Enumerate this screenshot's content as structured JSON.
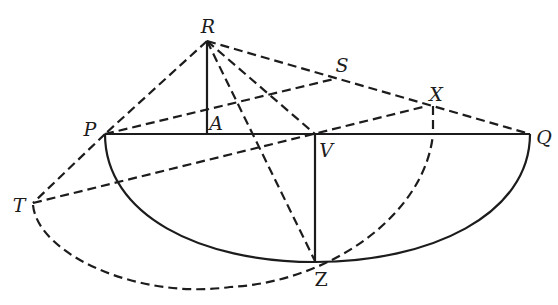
{
  "diagram": {
    "type": "geometry-construction",
    "stroke_color": "#1c1c1c",
    "background": "#ffffff",
    "points": [
      {
        "id": "R",
        "label": "R",
        "x": 207,
        "y": 41,
        "label_x": 208,
        "label_y": 26,
        "italic": true
      },
      {
        "id": "S",
        "label": "S",
        "x": 334,
        "y": 79,
        "label_x": 342,
        "label_y": 65,
        "italic": true
      },
      {
        "id": "X",
        "label": "X",
        "x": 427,
        "y": 106,
        "label_x": 436,
        "label_y": 94,
        "italic": true
      },
      {
        "id": "P",
        "label": "P",
        "x": 105,
        "y": 134,
        "label_x": 90,
        "label_y": 129,
        "italic": true
      },
      {
        "id": "A",
        "label": "A",
        "x": 207,
        "y": 134,
        "label_x": 216,
        "label_y": 123,
        "italic": true
      },
      {
        "id": "V",
        "label": "V",
        "x": 315,
        "y": 134,
        "label_x": 326,
        "label_y": 150,
        "italic": true
      },
      {
        "id": "Q",
        "label": "Q",
        "x": 530,
        "y": 134,
        "label_x": 544,
        "label_y": 137,
        "italic": true
      },
      {
        "id": "T",
        "label": "T",
        "x": 33,
        "y": 203,
        "label_x": 19,
        "label_y": 205,
        "italic": true
      },
      {
        "id": "Z",
        "label": "Z",
        "x": 315,
        "y": 261,
        "label_x": 321,
        "label_y": 279,
        "italic": false
      }
    ],
    "segments": [
      {
        "name": "segment-PQ",
        "from": "P",
        "to": "Q",
        "style": "solid"
      },
      {
        "name": "segment-RA",
        "from": "R",
        "to": "A",
        "style": "solid"
      },
      {
        "name": "segment-VZ",
        "from": "V",
        "to": "Z",
        "style": "solid"
      },
      {
        "name": "segment-RP",
        "from": "R",
        "to": "P",
        "style": "dashed"
      },
      {
        "name": "segment-RQ",
        "from": "R",
        "to": "Q",
        "style": "dashed"
      },
      {
        "name": "segment-RV",
        "from": "R",
        "to": "V",
        "style": "dashed"
      },
      {
        "name": "segment-RZ",
        "from": "R",
        "to": "Z",
        "style": "dashed"
      },
      {
        "name": "segment-PS",
        "from": "P",
        "to": "S",
        "style": "dashed"
      },
      {
        "name": "segment-PT",
        "from": "P",
        "to": "T",
        "style": "dashed"
      },
      {
        "name": "segment-TX",
        "from": "T",
        "to": "X",
        "style": "dashed"
      },
      {
        "name": "segment-X-drop",
        "from": "X",
        "to": "X-foot",
        "style": "dashed"
      }
    ],
    "curves": [
      {
        "name": "semi-ellipse-PZQ",
        "style": "solid",
        "description": "lower half-ellipse from P through Z to Q"
      },
      {
        "name": "dashed-arc-TZX",
        "style": "dashed",
        "description": "dashed curve from T sweeping below Z and up to the foot of X on PQ"
      }
    ]
  }
}
